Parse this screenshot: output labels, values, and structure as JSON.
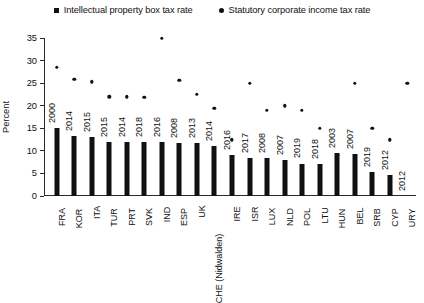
{
  "legend": {
    "items": [
      {
        "label": "Intellectual property box tax rate",
        "marker": "square-marker-icon"
      },
      {
        "label": "Statutory corporate income tax rate",
        "marker": "circle-marker-icon"
      }
    ]
  },
  "axes": {
    "ylabel": "Percent",
    "yticks": [
      "0",
      "5",
      "10",
      "15",
      "20",
      "25",
      "30",
      "35"
    ]
  },
  "chart_data": {
    "type": "bar",
    "title": "",
    "xlabel": "",
    "ylabel": "Percent",
    "ylim": [
      0,
      35
    ],
    "grid": false,
    "legend_position": "top-center",
    "categories": [
      "FRA",
      "KOR",
      "ITA",
      "TUR",
      "PRT",
      "SVK",
      "IND",
      "ESP",
      "UK",
      "CHE (Nidwalden)",
      "IRE",
      "ISR",
      "LUX",
      "NLD",
      "POL",
      "LTU",
      "HUN",
      "BEL",
      "SRB",
      "CYP",
      "URY"
    ],
    "point_labels": [
      "2000",
      "2014",
      "2015",
      "2015",
      "2014",
      "2018",
      "2016",
      "2008",
      "2013",
      "2014",
      "2016",
      "2017",
      "2008",
      "2007",
      "2019",
      "2018",
      "2003",
      "2007",
      "2019",
      "2012",
      "2012"
    ],
    "series": [
      {
        "name": "Intellectual property box tax rate",
        "type": "bar",
        "values": [
          15.0,
          13.2,
          13.0,
          12.0,
          12.0,
          12.0,
          11.9,
          11.8,
          11.7,
          11.0,
          9.0,
          8.4,
          8.4,
          7.9,
          7.2,
          7.0,
          9.5,
          9.4,
          5.3,
          4.7,
          0.0
        ]
      },
      {
        "name": "Statutory corporate income tax rate",
        "type": "scatter",
        "values": [
          28.6,
          25.9,
          25.3,
          22.0,
          22.0,
          21.9,
          34.9,
          25.7,
          22.6,
          19.5,
          12.5,
          25.0,
          19.0,
          20.0,
          19.0,
          15.0,
          9.0,
          25.0,
          15.0,
          12.5,
          25.0
        ]
      }
    ]
  }
}
